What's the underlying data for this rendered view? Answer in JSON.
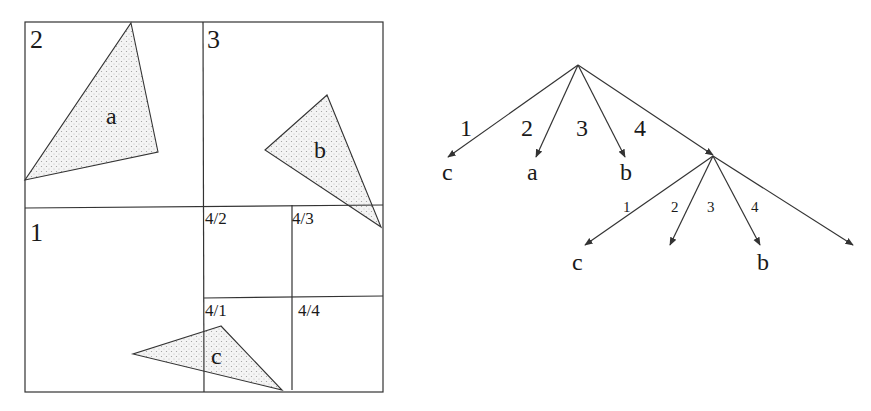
{
  "colors": {
    "stroke": "#333333",
    "text": "#1a1a1a",
    "fill_dots": "#9a9a9a",
    "background": "#ffffff"
  },
  "quadtree": {
    "quadrants": [
      {
        "label": "2",
        "x": 30,
        "y": 48
      },
      {
        "label": "3",
        "x": 207,
        "y": 48
      },
      {
        "label": "1",
        "x": 30,
        "y": 241
      }
    ],
    "subquadrants": [
      {
        "label": "4/2",
        "x": 205,
        "y": 224
      },
      {
        "label": "4/3",
        "x": 292,
        "y": 224
      },
      {
        "label": "4/1",
        "x": 205,
        "y": 316
      },
      {
        "label": "4/4",
        "x": 298,
        "y": 316
      }
    ],
    "objects": [
      {
        "label": "a",
        "points": "131,23 158,152 25,180",
        "lx": 106,
        "ly": 124
      },
      {
        "label": "b",
        "points": "327,95 265,150 381,227",
        "lx": 314,
        "ly": 158
      },
      {
        "label": "c",
        "points": "221,326 133,354 282,390",
        "lx": 211,
        "ly": 364
      }
    ]
  },
  "tree": {
    "root": {
      "x": 578,
      "y": 65
    },
    "level1": [
      {
        "edge_label": "1",
        "target": "c",
        "ex": 448,
        "ey": 157,
        "elx": 460,
        "ely": 136,
        "tx": 442,
        "ty": 180
      },
      {
        "edge_label": "2",
        "target": "a",
        "ex": 536,
        "ey": 157,
        "elx": 521,
        "ely": 136,
        "tx": 527,
        "ty": 180
      },
      {
        "edge_label": "3",
        "target": "b",
        "ex": 625,
        "ey": 157,
        "elx": 576,
        "ely": 136,
        "tx": 620,
        "ty": 180
      },
      {
        "edge_label": "4",
        "target": "",
        "ex": 713,
        "ey": 155,
        "elx": 634,
        "ely": 136,
        "tx": 0,
        "ty": 0
      }
    ],
    "node4": {
      "x": 713,
      "y": 156
    },
    "level2": [
      {
        "edge_label": "1",
        "target": "c",
        "ex": 585,
        "ey": 245,
        "elx": 623,
        "ely": 212,
        "tx": 572,
        "ty": 270
      },
      {
        "edge_label": "2",
        "target": "",
        "ex": 670,
        "ey": 245,
        "elx": 671,
        "ely": 212,
        "tx": 0,
        "ty": 0
      },
      {
        "edge_label": "3",
        "target": "",
        "ex": 760,
        "ey": 245,
        "elx": 707,
        "ely": 212,
        "tx": 0,
        "ty": 0
      },
      {
        "edge_label": "4",
        "target": "b",
        "ex": 760,
        "ey": 245,
        "elx": 751,
        "ely": 212,
        "tx": 757,
        "ty": 270
      },
      {
        "edge_label": "",
        "target": "",
        "ex": 853,
        "ey": 245,
        "elx": 0,
        "ely": 0,
        "tx": 0,
        "ty": 0
      }
    ]
  }
}
